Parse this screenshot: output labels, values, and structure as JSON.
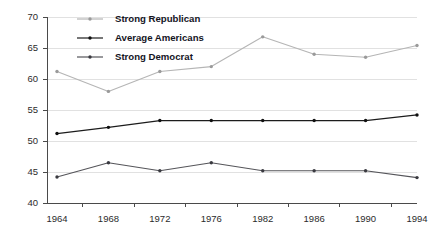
{
  "chart_data": {
    "type": "line",
    "title": "",
    "subtitle": "",
    "xlabel": "",
    "ylabel": "",
    "categories": [
      "1964",
      "1968",
      "1972",
      "1976",
      "1982",
      "1986",
      "1990",
      "1994"
    ],
    "x_tick_labels": [
      "1964",
      "1968",
      "1972",
      "1976",
      "1982",
      "1986",
      "1990",
      "1994"
    ],
    "y_tick_labels": [
      "40",
      "45",
      "50",
      "55",
      "60",
      "65",
      "70"
    ],
    "y_ticks": [
      40,
      45,
      50,
      55,
      60,
      65,
      70
    ],
    "ylim": [
      40,
      70
    ],
    "grid": "horizontal",
    "legend_position": "top-left-inside",
    "series": [
      {
        "name": "Strong Republican",
        "color": "#b5b5b5",
        "marker_color": "#9a9a9a",
        "values": [
          61.2,
          58.0,
          61.2,
          62.0,
          66.8,
          64.0,
          63.5,
          65.4
        ]
      },
      {
        "name": "Average Americans",
        "color": "#1c1c1c",
        "marker_color": "#101010",
        "values": [
          51.2,
          52.2,
          53.3,
          53.3,
          53.3,
          53.3,
          53.3,
          54.2
        ]
      },
      {
        "name": "Strong Democrat",
        "color": "#55555a",
        "marker_color": "#3a3a40",
        "values": [
          44.2,
          46.5,
          45.2,
          46.5,
          45.2,
          45.2,
          45.2,
          44.1
        ]
      }
    ]
  },
  "legend": {
    "items": [
      {
        "label": "Strong Republican",
        "key": "rep"
      },
      {
        "label": "Average Americans",
        "key": "avg"
      },
      {
        "label": "Strong Democrat",
        "key": "dem"
      }
    ]
  },
  "colors": {
    "background": "#ffffff",
    "gridline": "#d9d9d9",
    "axis": "#4a4a4a",
    "text": "#2b2b2b",
    "legend_text": "#14141e",
    "strong_republican": "#b5b5b5",
    "average_americans": "#1c1c1c",
    "strong_democrat": "#55555a"
  }
}
